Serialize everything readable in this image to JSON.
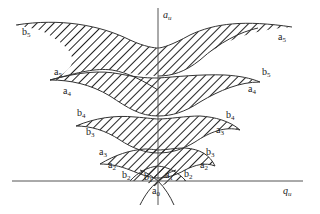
{
  "diagram": {
    "type": "mathieu-stability-diagram",
    "axes": {
      "vertical": {
        "symbol": "a",
        "subscript": "u"
      },
      "horizontal": {
        "symbol": "q",
        "subscript": "u"
      }
    },
    "curve_labels": [
      {
        "id": "b5-left",
        "base": "b",
        "sub": "5",
        "x": 22,
        "y": 27
      },
      {
        "id": "a5-right",
        "base": "a",
        "sub": "5",
        "x": 278,
        "y": 32
      },
      {
        "id": "a5-left",
        "base": "a",
        "sub": "5",
        "x": 54,
        "y": 67
      },
      {
        "id": "a4-left",
        "base": "a",
        "sub": "4",
        "x": 63,
        "y": 86
      },
      {
        "id": "b5-right",
        "base": "b",
        "sub": "5",
        "x": 262,
        "y": 67
      },
      {
        "id": "a4-right",
        "base": "a",
        "sub": "4",
        "x": 248,
        "y": 84
      },
      {
        "id": "b4-left",
        "base": "b",
        "sub": "4",
        "x": 77,
        "y": 108
      },
      {
        "id": "b3-left",
        "base": "b",
        "sub": "3",
        "x": 86,
        "y": 127
      },
      {
        "id": "b4-right",
        "base": "b",
        "sub": "4",
        "x": 226,
        "y": 110
      },
      {
        "id": "a3-right",
        "base": "a",
        "sub": "3",
        "x": 216,
        "y": 125
      },
      {
        "id": "a3-left",
        "base": "a",
        "sub": "3",
        "x": 99,
        "y": 147
      },
      {
        "id": "a2-left",
        "base": "a",
        "sub": "2",
        "x": 108,
        "y": 160
      },
      {
        "id": "b3-right",
        "base": "b",
        "sub": "3",
        "x": 206,
        "y": 147
      },
      {
        "id": "a2-right",
        "base": "a",
        "sub": "2",
        "x": 200,
        "y": 160
      },
      {
        "id": "b2-left",
        "base": "b",
        "sub": "2",
        "x": 122,
        "y": 170
      },
      {
        "id": "b1",
        "base": "b",
        "sub": "1",
        "x": 144,
        "y": 172
      },
      {
        "id": "a1",
        "base": "a",
        "sub": "1",
        "x": 165,
        "y": 170
      },
      {
        "id": "b2-right",
        "base": "b",
        "sub": "2",
        "x": 184,
        "y": 169
      },
      {
        "id": "a0",
        "base": "a",
        "sub": "0",
        "x": 152,
        "y": 186
      }
    ],
    "colors": {
      "line": "#333333",
      "hatch": "#222222",
      "background": "#ffffff"
    }
  }
}
